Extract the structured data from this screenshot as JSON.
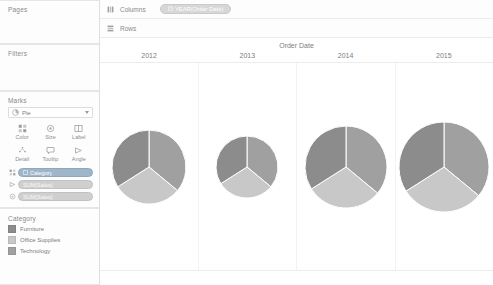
{
  "sidebar": {
    "pages": {
      "title": "Pages"
    },
    "filters": {
      "title": "Filters"
    },
    "marks": {
      "title": "Marks",
      "mark_type": "Pie",
      "encodings": [
        {
          "name": "color",
          "label": "Color",
          "icon": "color-icon"
        },
        {
          "name": "size",
          "label": "Size",
          "icon": "size-icon"
        },
        {
          "name": "label",
          "label": "Label",
          "icon": "label-icon"
        },
        {
          "name": "detail",
          "label": "Detail",
          "icon": "detail-icon"
        },
        {
          "name": "tooltip",
          "label": "Tooltip",
          "icon": "tooltip-icon"
        },
        {
          "name": "angle",
          "label": "Angle",
          "icon": "angle-icon"
        }
      ],
      "pills": [
        {
          "label": "Category",
          "kind": "dimension",
          "shelf_icon": "color-icon"
        },
        {
          "label": "SUM(Sales)",
          "kind": "measure",
          "shelf_icon": "angle-icon"
        },
        {
          "label": "SUM(Sales)",
          "kind": "measure",
          "shelf_icon": "size-icon"
        }
      ]
    },
    "legend": {
      "title": "Category",
      "items": [
        {
          "label": "Furniture",
          "color": "#8c8c8c"
        },
        {
          "label": "Office Supplies",
          "color": "#c8c8c8"
        },
        {
          "label": "Technology",
          "color": "#a0a0a0"
        }
      ]
    }
  },
  "shelves": {
    "columns": {
      "label": "Columns",
      "pill": "YEAR(Order Date)"
    },
    "rows": {
      "label": "Rows",
      "pill": ""
    }
  },
  "chart_data": {
    "type": "pie",
    "title": "Order Date",
    "xlabel": "Order Date",
    "ylabel": "",
    "legend_position": "left-sidebar",
    "grid": false,
    "categories": [
      "Furniture",
      "Office Supplies",
      "Technology"
    ],
    "colors": [
      "#8c8c8c",
      "#c8c8c8",
      "#a0a0a0"
    ],
    "panels": [
      {
        "label": "2012",
        "radius": 37,
        "values": [
          34,
          30,
          36
        ],
        "slices": [
          {
            "name": "Technology",
            "value": 36,
            "color": "#a0a0a0"
          },
          {
            "name": "Office Supplies",
            "value": 30,
            "color": "#c8c8c8"
          },
          {
            "name": "Furniture",
            "value": 34,
            "color": "#8c8c8c"
          }
        ]
      },
      {
        "label": "2013",
        "radius": 31,
        "values": [
          34,
          30,
          36
        ],
        "slices": [
          {
            "name": "Technology",
            "value": 36,
            "color": "#a0a0a0"
          },
          {
            "name": "Office Supplies",
            "value": 30,
            "color": "#c8c8c8"
          },
          {
            "name": "Furniture",
            "value": 34,
            "color": "#8c8c8c"
          }
        ]
      },
      {
        "label": "2014",
        "radius": 41,
        "values": [
          34,
          30,
          36
        ],
        "slices": [
          {
            "name": "Technology",
            "value": 36,
            "color": "#a0a0a0"
          },
          {
            "name": "Office Supplies",
            "value": 30,
            "color": "#c8c8c8"
          },
          {
            "name": "Furniture",
            "value": 34,
            "color": "#8c8c8c"
          }
        ]
      },
      {
        "label": "2015",
        "radius": 45,
        "values": [
          34,
          30,
          36
        ],
        "slices": [
          {
            "name": "Technology",
            "value": 36,
            "color": "#a0a0a0"
          },
          {
            "name": "Office Supplies",
            "value": 30,
            "color": "#c8c8c8"
          },
          {
            "name": "Furniture",
            "value": 34,
            "color": "#8c8c8c"
          }
        ]
      }
    ]
  }
}
